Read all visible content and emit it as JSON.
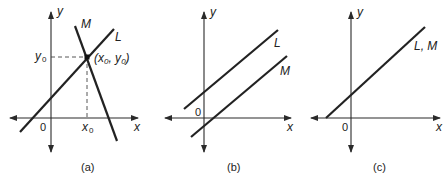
{
  "figure": {
    "panels": [
      {
        "id": "a",
        "caption": "(a)",
        "axis_x_label": "x",
        "axis_y_label": "y",
        "origin_label": "0",
        "lines": [
          {
            "name": "L",
            "label": "L",
            "description": "positive slope line"
          },
          {
            "name": "M",
            "label": "M",
            "description": "negative slope line"
          }
        ],
        "intersection_label": "(x0, y0)",
        "intersection_label_parts": {
          "open": "(x",
          "sub1": "0",
          "comma": ", y",
          "sub2": "0",
          "close": ")"
        },
        "x0_label": "x",
        "x0_sub": "0",
        "y0_label": "y",
        "y0_sub": "0",
        "relation": "intersecting"
      },
      {
        "id": "b",
        "caption": "(b)",
        "axis_x_label": "x",
        "axis_y_label": "y",
        "origin_label": "0",
        "lines": [
          {
            "name": "L",
            "label": "L"
          },
          {
            "name": "M",
            "label": "M"
          }
        ],
        "relation": "parallel"
      },
      {
        "id": "c",
        "caption": "(c)",
        "axis_x_label": "x",
        "axis_y_label": "y",
        "origin_label": "0",
        "lines": [
          {
            "name": "L, M",
            "label": "L, M"
          }
        ],
        "relation": "coincident"
      }
    ]
  }
}
